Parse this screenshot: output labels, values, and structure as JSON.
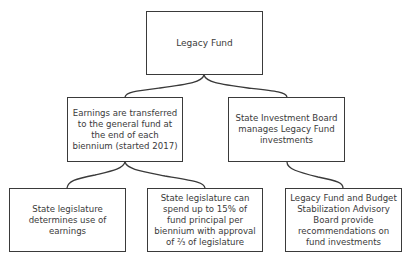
{
  "diagram": {
    "type": "hierarchy",
    "nodes": [
      {
        "id": "root",
        "text": "Legacy Fund"
      },
      {
        "id": "earnings",
        "text": "Earnings are transferred to the general fund at the end of each biennium (started 2017)"
      },
      {
        "id": "sib",
        "text": "State Investment Board manages Legacy Fund investments"
      },
      {
        "id": "legislature_use",
        "text": "State legislature determines use of earnings"
      },
      {
        "id": "legislature_spend",
        "text": "State legislature can spend up to 15% of fund principal per biennium with approval of ⅔ of legislature"
      },
      {
        "id": "advisory",
        "text": "Legacy Fund and Budget Stabilization Advisory Board provide recommendations on fund investments"
      }
    ],
    "edges": [
      {
        "from": "root",
        "to": "earnings"
      },
      {
        "from": "root",
        "to": "sib"
      },
      {
        "from": "earnings",
        "to": "legislature_use"
      },
      {
        "from": "earnings",
        "to": "legislature_spend"
      },
      {
        "from": "sib",
        "to": "advisory"
      }
    ],
    "colors": {
      "border": "#3a3a3a",
      "text": "#3a3a3a",
      "background": "#ffffff"
    }
  }
}
